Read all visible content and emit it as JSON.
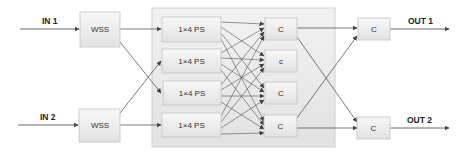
{
  "diagram": {
    "inputs": [
      {
        "label": "IN 1"
      },
      {
        "label": "IN 2"
      }
    ],
    "outputs": [
      {
        "label": "OUT 1"
      },
      {
        "label": "OUT 2"
      }
    ],
    "wss": [
      {
        "label": "WSS"
      },
      {
        "label": "WSS"
      }
    ],
    "splitters": [
      {
        "label": "1×4 PS"
      },
      {
        "label": "1×4 PS"
      },
      {
        "label": "1×4 PS"
      },
      {
        "label": "1×4 PS"
      }
    ],
    "middle_couplers": [
      {
        "label": "C"
      },
      {
        "label": "c"
      },
      {
        "label": "C"
      },
      {
        "label": "C"
      }
    ],
    "output_couplers": [
      {
        "label": "C"
      },
      {
        "label": "C"
      }
    ],
    "colors": {
      "container_fill": "#e8e8e8",
      "box_fill_top": "#f7f7f7",
      "box_fill_bottom": "#e4e4e4",
      "box_stroke": "#c4c4c4",
      "line": "#444444"
    }
  }
}
